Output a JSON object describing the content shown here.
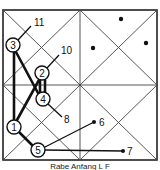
{
  "diagram": {
    "type": "go-board-sequence-diagram",
    "frame": {
      "x": 3,
      "y": 10,
      "width": 154,
      "height": 150,
      "stroke": "#222222"
    },
    "grid_lines": [
      {
        "name": "diagonal-main",
        "x1": 3,
        "y1": 10,
        "x2": 157,
        "y2": 160
      },
      {
        "name": "diagonal-anti",
        "x1": 157,
        "y1": 10,
        "x2": 3,
        "y2": 160
      },
      {
        "name": "vertical-mid",
        "x1": 80,
        "y1": 10,
        "x2": 80,
        "y2": 160
      },
      {
        "name": "horizontal-mid",
        "x1": 3,
        "y1": 85,
        "x2": 157,
        "y2": 85
      },
      {
        "name": "diamond-top-right",
        "x1": 80,
        "y1": 10,
        "x2": 157,
        "y2": 85
      },
      {
        "name": "diamond-right-bottom",
        "x1": 157,
        "y1": 85,
        "x2": 80,
        "y2": 160
      },
      {
        "name": "diamond-bottom-left",
        "x1": 80,
        "y1": 160,
        "x2": 3,
        "y2": 85
      },
      {
        "name": "diamond-left-top",
        "x1": 3,
        "y1": 85,
        "x2": 80,
        "y2": 10
      }
    ],
    "nodes": [
      {
        "id": "1",
        "label": "1",
        "x": 14,
        "y": 127
      },
      {
        "id": "2",
        "label": "2",
        "x": 42,
        "y": 73
      },
      {
        "id": "3",
        "label": "3",
        "x": 13,
        "y": 45
      },
      {
        "id": "4",
        "label": "4",
        "x": 43,
        "y": 99
      },
      {
        "id": "5",
        "label": "5",
        "x": 38,
        "y": 150
      }
    ],
    "thick_edges": [
      {
        "from": "3",
        "to": "1",
        "x1": 14,
        "y1": 52,
        "x2": 14,
        "y2": 120
      },
      {
        "from": "3",
        "to": "4",
        "x1": 16,
        "y1": 52,
        "x2": 38,
        "y2": 93
      },
      {
        "from": "1",
        "to": "2",
        "x1": 17,
        "y1": 120,
        "x2": 39,
        "y2": 80
      },
      {
        "from": "2",
        "to": "4",
        "x1": 40,
        "y1": 80,
        "x2": 40,
        "y2": 92
      },
      {
        "from": "2",
        "to": "4b",
        "x1": 45,
        "y1": 80,
        "x2": 45,
        "y2": 92
      },
      {
        "from": "1",
        "to": "5",
        "x1": 19,
        "y1": 132,
        "x2": 32,
        "y2": 145
      }
    ],
    "pointer_edges": [
      {
        "from": "3",
        "label": "11",
        "x1": 18,
        "y1": 40,
        "x2": 31,
        "y2": 26,
        "label_x": 34,
        "label_y": 26,
        "dot": false
      },
      {
        "from": "2",
        "label": "10",
        "x1": 47,
        "y1": 68,
        "x2": 59,
        "y2": 55,
        "label_x": 61,
        "label_y": 54,
        "dot": false
      },
      {
        "from": "4",
        "label": "8",
        "x1": 48,
        "y1": 104,
        "x2": 62,
        "y2": 117,
        "label_x": 64,
        "label_y": 123,
        "dot": false
      },
      {
        "from": "5",
        "label": "6",
        "x1": 45,
        "y1": 147,
        "x2": 94,
        "y2": 122,
        "label_x": 99,
        "label_y": 126,
        "dot": true
      },
      {
        "from": "5",
        "label": "7",
        "x1": 45,
        "y1": 150,
        "x2": 123,
        "y2": 151,
        "label_x": 127,
        "label_y": 155,
        "dot": true
      }
    ],
    "free_points": [
      {
        "x": 121,
        "y": 19
      },
      {
        "x": 93,
        "y": 48
      },
      {
        "x": 146,
        "y": 43
      }
    ],
    "node_radius": 7,
    "caption": "Rabe Anfang L F"
  }
}
